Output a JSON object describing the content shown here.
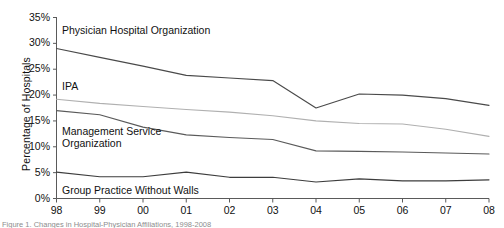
{
  "chart_data": {
    "type": "line",
    "title": "",
    "xlabel": "",
    "ylabel": "Percentage of Hospitals",
    "categories": [
      "98",
      "99",
      "00",
      "01",
      "02",
      "03",
      "04",
      "05",
      "06",
      "07",
      "08"
    ],
    "ylim": [
      0,
      35
    ],
    "ytick_labels": [
      "0%",
      "5%",
      "10%",
      "15%",
      "20%",
      "25%",
      "30%",
      "35%"
    ],
    "ytick_values": [
      0,
      5,
      10,
      15,
      20,
      25,
      30,
      35
    ],
    "ytick_step": 5,
    "grid": false,
    "legend": "inline-annotations",
    "series": [
      {
        "name": "Physician Hospital Organization",
        "color": "#4a4a4a",
        "values": [
          29.0,
          27.3,
          25.6,
          23.8,
          23.3,
          22.8,
          17.5,
          20.2,
          20.0,
          19.3,
          18.0
        ]
      },
      {
        "name": "IPA",
        "color": "#b0b0b0",
        "values": [
          19.2,
          18.4,
          17.8,
          17.2,
          16.7,
          16.0,
          15.0,
          14.5,
          14.4,
          13.4,
          12.0
        ]
      },
      {
        "name": "Management Service Organization",
        "color": "#5a5a5a",
        "values": [
          17.0,
          16.2,
          13.8,
          12.3,
          11.8,
          11.4,
          9.2,
          9.1,
          9.0,
          8.8,
          8.6
        ]
      },
      {
        "name": "Group Practice Without Walls",
        "color": "#3d3d3d",
        "values": [
          5.1,
          4.2,
          4.2,
          5.1,
          4.1,
          4.1,
          3.2,
          3.8,
          3.4,
          3.4,
          3.6
        ]
      }
    ],
    "annotations": [
      {
        "text": "Physician Hospital Organization",
        "series": "Physician Hospital Organization"
      },
      {
        "text": "IPA",
        "series": "IPA"
      },
      {
        "text": "Management Service\nOrganization",
        "series": "Management Service Organization"
      },
      {
        "text": "Group Practice Without Walls",
        "series": "Group Practice Without Walls"
      }
    ]
  },
  "axis": {
    "y_title": "Percentage of Hospitals",
    "y_ticks": [
      "35%",
      "30%",
      "25%",
      "20%",
      "15%",
      "10%",
      "5%",
      "0%"
    ],
    "x_ticks": [
      "98",
      "99",
      "00",
      "01",
      "02",
      "03",
      "04",
      "05",
      "06",
      "07",
      "08"
    ]
  },
  "annotations": {
    "pho": "Physician Hospital Organization",
    "ipa": "IPA",
    "mso_line1": "Management Service",
    "mso_line2": "Organization",
    "gpww": "Group Practice Without Walls"
  },
  "caption": {
    "text": "Figure 1. Changes in Hospital-Physician Affiliations, 1998-2008"
  },
  "colors": {
    "axis": "#5a5a5a",
    "text": "#111111",
    "pho_line": "#4a4a4a",
    "ipa_line": "#b0b0b0",
    "mso_line": "#5a5a5a",
    "gpww_line": "#3d3d3d",
    "background": "#ffffff"
  }
}
